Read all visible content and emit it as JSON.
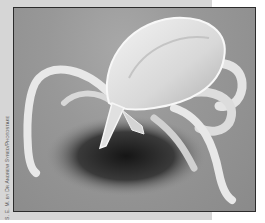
{
  "figure": {
    "credit": "S. E. M. by Dr Andrew Syred/Photostake",
    "colors": {
      "frame_band": "#d6d6d6",
      "photo_border": "#2c2c2c",
      "background": "#9a9a9a",
      "specimen_highlight": "#f0f0f0",
      "shadow": "#1e1e1e"
    }
  }
}
